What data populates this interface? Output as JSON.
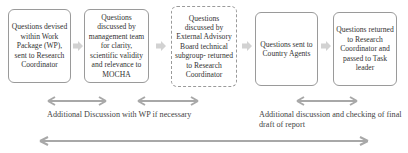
{
  "diagram": {
    "steps": [
      {
        "text": "Questions devised within Work Package (WP), sent to Research Coordinator"
      },
      {
        "text": "Questions discussed by management team for clarity, scientific validity and relevance to MOCHA"
      },
      {
        "text": "Questions discussed by External Advisory Board technical subgroup- returned to Research Coordinator"
      },
      {
        "text": "Questions sent to Country Agents"
      },
      {
        "text": "Questions returned to Research Coordinator and passed to Task leader"
      }
    ],
    "annotations": {
      "left": "Additional Discussion with WP if necessary",
      "right": "Additional discussion and checking of final draft of report"
    },
    "colors": {
      "arrow": "#b0b0b0",
      "border": "#9a9a9a"
    }
  }
}
